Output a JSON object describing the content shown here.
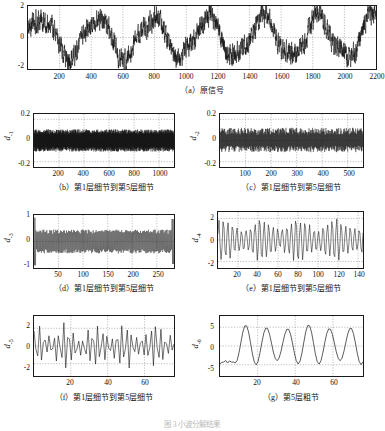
{
  "figure": {
    "bottom_caption": "图 3  小波分解结果"
  },
  "chart_data": [
    {
      "id": "a",
      "type": "line",
      "title": "（a）原信号",
      "ylabel": "x",
      "xlabel": "",
      "xlim": [
        0,
        2200
      ],
      "ylim": [
        -2,
        2
      ],
      "yticks": [
        -2,
        0,
        2
      ],
      "ytick_labels": [
        "-2",
        "0",
        "2"
      ],
      "xticks": [
        200,
        400,
        600,
        800,
        1000,
        1200,
        1400,
        1600,
        1800,
        2000,
        2200
      ],
      "xtick_labels": [
        "200",
        "400",
        "600",
        "800",
        "1000",
        "1200",
        "1400",
        "1600",
        "1800",
        "2000",
        "2200"
      ],
      "grid": true,
      "n_points": 2200,
      "description": "Noisy oscillating signal, low-frequency carrier period about 350 samples, amplitude about 1.3, with broadband noise of amplitude about 0.55",
      "carrier_period": 350,
      "carrier_amp": 1.25,
      "noise_amp": 0.55
    },
    {
      "id": "b",
      "type": "line",
      "title": "（b）第1层细节到第5层细节",
      "ylabel": "d-1",
      "xlabel": "",
      "xlim": [
        0,
        1120
      ],
      "ylim": [
        -0.25,
        0.25
      ],
      "yticks": [
        -0.2,
        0,
        0.2
      ],
      "ytick_labels": [
        "-0.2",
        "0",
        "0.2"
      ],
      "xticks": [
        200,
        400,
        600,
        800,
        1000
      ],
      "xtick_labels": [
        "200",
        "400",
        "600",
        "800",
        "1000"
      ],
      "grid": true,
      "n_points": 1120,
      "description": "Dense high-frequency detail band, nearly uniform envelope of about +/-0.11",
      "band_amp": 0.105
    },
    {
      "id": "c",
      "type": "line",
      "title": "（c）第1层细节到第5层细节",
      "ylabel": "d-2",
      "xlabel": "",
      "xlim": [
        0,
        560
      ],
      "ylim": [
        -0.25,
        0.25
      ],
      "yticks": [
        -0.2,
        0,
        0.2
      ],
      "ytick_labels": [
        "-0.2",
        "0",
        "0.2"
      ],
      "xticks": [
        100,
        200,
        300,
        400,
        500
      ],
      "xtick_labels": [
        "100",
        "200",
        "300",
        "400",
        "500"
      ],
      "grid": true,
      "n_points": 560,
      "description": "Dense detail band, envelope about +/-0.12 with slight upward bias of peaks",
      "band_amp": 0.12
    },
    {
      "id": "d",
      "type": "line",
      "title": "（d）第1层细节到第5层细节",
      "ylabel": "d-3",
      "xlabel": "",
      "xlim": [
        0,
        285
      ],
      "ylim": [
        -1,
        1
      ],
      "yticks": [
        -1,
        0,
        1
      ],
      "ytick_labels": [
        "-1",
        "0",
        "1"
      ],
      "xticks": [
        50,
        100,
        150,
        200,
        250
      ],
      "xtick_labels": [
        "50",
        "100",
        "150",
        "200",
        "250"
      ],
      "grid": true,
      "n_points": 285,
      "description": "Dense detail band with dark core of about +/-0.3 and regular spikes reaching about +0.45/-0.5; edge transients reach +/-0.9",
      "band_amp": 0.45,
      "core_amp": 0.28
    },
    {
      "id": "e",
      "type": "line",
      "title": "（e）第1层细节到第5层细节",
      "ylabel": "d-4",
      "xlabel": "",
      "xlim": [
        0,
        145
      ],
      "ylim": [
        -2.6,
        2.6
      ],
      "yticks": [
        -2,
        0,
        2
      ],
      "ytick_labels": [
        "-2",
        "0",
        "2"
      ],
      "xticks": [
        20,
        40,
        60,
        80,
        100,
        120,
        140
      ],
      "xtick_labels": [
        "20",
        "40",
        "60",
        "80",
        "100",
        "120",
        "140"
      ],
      "grid": true,
      "n_points": 145,
      "description": "Oscillation with period about 4.5 samples, amplitude about 1.8 modulated slowly",
      "osc_period": 4.5,
      "osc_amp": 1.8
    },
    {
      "id": "f",
      "type": "line",
      "title": "（f）第1层细节到第5层细节",
      "ylabel": "d-5",
      "xlabel": "",
      "xlim": [
        0,
        76
      ],
      "ylim": [
        -3.4,
        3.4
      ],
      "yticks": [
        -2,
        0,
        2
      ],
      "ytick_labels": [
        "-2",
        "0",
        "2"
      ],
      "xticks": [
        20,
        40,
        60
      ],
      "xtick_labels": [
        "20",
        "40",
        "60"
      ],
      "grid": true,
      "n_points": 76,
      "description": "Oscillation with period about 2.6 samples, amplitude about 2.4 with modulation",
      "osc_period": 2.6,
      "osc_amp": 2.4
    },
    {
      "id": "g",
      "type": "line",
      "title": "（g）第5层粗节",
      "ylabel": "d-6",
      "xlabel": "",
      "xlim": [
        0,
        76
      ],
      "ylim": [
        -8,
        8
      ],
      "yticks": [
        -5,
        0,
        5
      ],
      "ytick_labels": [
        "-5",
        "0",
        "5"
      ],
      "xticks": [
        20,
        40,
        60
      ],
      "xtick_labels": [
        "20",
        "40",
        "60"
      ],
      "grid": true,
      "n_points": 76,
      "description": "Smooth low-frequency approximation, period about 11 samples, amplitude about 5, flat low start until sample 8",
      "osc_period": 11,
      "osc_amp": 5.2
    }
  ]
}
